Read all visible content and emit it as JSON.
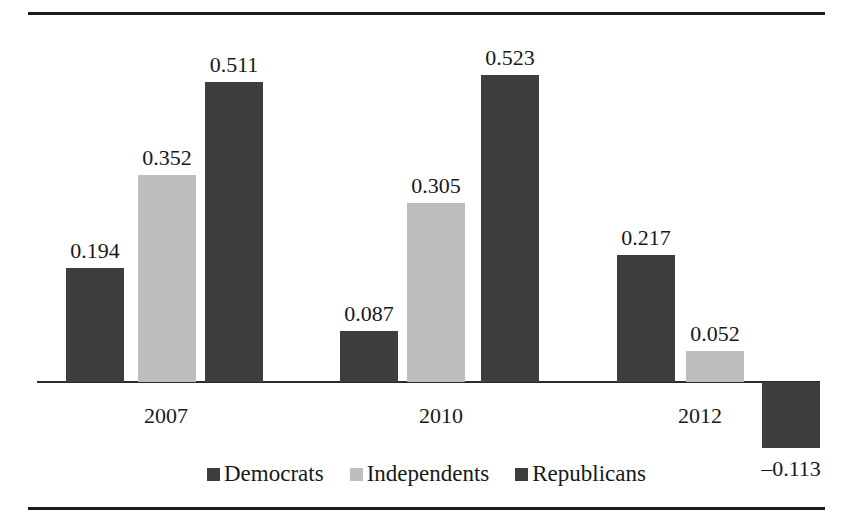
{
  "chart_data": {
    "type": "bar",
    "title": "",
    "subtitle": "",
    "xlabel": "",
    "ylabel": "",
    "categories": [
      "2007",
      "2010",
      "2012"
    ],
    "series": [
      {
        "name": "Democrats",
        "color": "#3d3d3d",
        "values": [
          0.194,
          0.087,
          0.217
        ]
      },
      {
        "name": "Independents",
        "color": "#bdbdbd",
        "values": [
          0.352,
          0.305,
          0.052
        ]
      },
      {
        "name": "Republicans",
        "color": "#3d3d3d",
        "values": [
          0.511,
          0.523,
          -0.113
        ]
      }
    ],
    "data_labels": [
      [
        "0.194",
        "0.352",
        "0.511"
      ],
      [
        "0.087",
        "0.305",
        "0.523"
      ],
      [
        "0.217",
        "0.052",
        "–0.113"
      ]
    ],
    "ylim": [
      -0.2,
      0.6
    ],
    "grid": false,
    "legend_position": "bottom",
    "axis_baseline_value": 0
  },
  "legend": {
    "items": [
      {
        "label": "Democrats",
        "color": "#3d3d3d"
      },
      {
        "label": "Independents",
        "color": "#bdbdbd"
      },
      {
        "label": "Republicans",
        "color": "#3d3d3d"
      }
    ]
  },
  "axis": {
    "category_labels": [
      "2007",
      "2010",
      "2012"
    ]
  },
  "colors": {
    "dark": "#3d3d3d",
    "light": "#bdbdbd",
    "rule": "#1c1c1c",
    "text": "#181818",
    "background": "#ffffff"
  }
}
